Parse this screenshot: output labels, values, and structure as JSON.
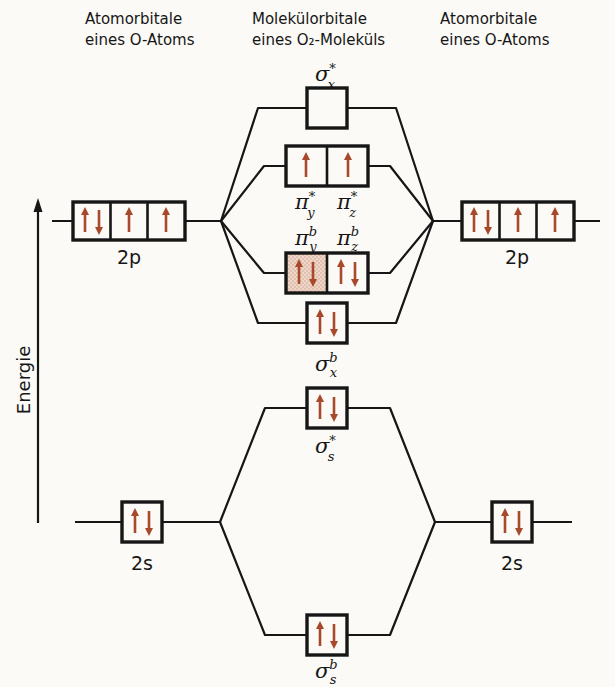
{
  "headers": {
    "left": {
      "line1": "Atomorbitale",
      "line2": "eines O-Atoms"
    },
    "center": {
      "line1": "Molekülorbitale",
      "line2": "eines O₂-Moleküls"
    },
    "right": {
      "line1": "Atomorbitale",
      "line2": "eines O-Atoms"
    }
  },
  "axis": {
    "label": "Energie"
  },
  "ao": {
    "left": {
      "p": {
        "label": "2p",
        "occupancy": [
          "↑↓",
          "↑",
          "↑"
        ]
      },
      "s": {
        "label": "2s",
        "occupancy": [
          "↑↓"
        ]
      }
    },
    "right": {
      "p": {
        "label": "2p",
        "occupancy": [
          "↑↓",
          "↑",
          "↑"
        ]
      },
      "s": {
        "label": "2s",
        "occupancy": [
          "↑↓"
        ]
      }
    }
  },
  "mo": {
    "sigma_x_star": {
      "base": "σ",
      "sub": "x",
      "sup": "*",
      "occupancy": "",
      "shaded": false
    },
    "pi_y_star": {
      "base": "π",
      "sub": "y",
      "sup": "*",
      "occupancy": "↑",
      "shaded": false
    },
    "pi_z_star": {
      "base": "π",
      "sub": "z",
      "sup": "*",
      "occupancy": "↑",
      "shaded": false
    },
    "pi_y_b": {
      "base": "π",
      "sub": "y",
      "sup": "b",
      "occupancy": "↑↓",
      "shaded": true
    },
    "pi_z_b": {
      "base": "π",
      "sub": "z",
      "sup": "b",
      "occupancy": "↑↓",
      "shaded": false
    },
    "sigma_x_b": {
      "base": "σ",
      "sub": "x",
      "sup": "b",
      "occupancy": "↑↓",
      "shaded": true
    },
    "sigma_s_star": {
      "base": "σ",
      "sub": "s",
      "sup": "*",
      "occupancy": "↑↓",
      "shaded": false
    },
    "sigma_s_b": {
      "base": "σ",
      "sub": "s",
      "sup": "b",
      "occupancy": "↑↓",
      "shaded": false
    }
  },
  "electrons": {
    "cells": [
      {
        "x": 92,
        "y": 221,
        "spins": "ud"
      },
      {
        "x": 129,
        "y": 221,
        "spins": "u"
      },
      {
        "x": 166,
        "y": 221,
        "spins": "u"
      },
      {
        "x": 481,
        "y": 221,
        "spins": "ud"
      },
      {
        "x": 518,
        "y": 221,
        "spins": "u"
      },
      {
        "x": 555,
        "y": 221,
        "spins": "u"
      },
      {
        "x": 306,
        "y": 166,
        "spins": "u"
      },
      {
        "x": 348,
        "y": 166,
        "spins": "u"
      },
      {
        "x": 306,
        "y": 273,
        "spins": "ud"
      },
      {
        "x": 348,
        "y": 273,
        "spins": "ud"
      },
      {
        "x": 327,
        "y": 323,
        "spins": "ud"
      },
      {
        "x": 327,
        "y": 408,
        "spins": "ud"
      },
      {
        "x": 142,
        "y": 522,
        "spins": "ud"
      },
      {
        "x": 512,
        "y": 522,
        "spins": "ud"
      },
      {
        "x": 327,
        "y": 635,
        "spins": "ud"
      }
    ]
  },
  "colors": {
    "arrow": "#a8492b",
    "shaded_fill": "#eed7c9",
    "stipple_dot": "#cf9e8a",
    "line": "#161616"
  }
}
